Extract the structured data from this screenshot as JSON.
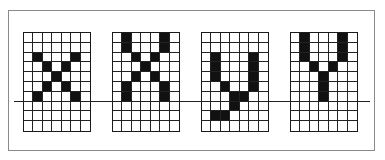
{
  "figure": {
    "grid_cols": 7,
    "grid_rows": 10,
    "baseline_row_after": 6,
    "glyphs": [
      {
        "name": "x",
        "left": 23,
        "pixels": [
          [
            2,
            1
          ],
          [
            2,
            5
          ],
          [
            3,
            2
          ],
          [
            3,
            4
          ],
          [
            4,
            3
          ],
          [
            5,
            2
          ],
          [
            5,
            4
          ],
          [
            6,
            1
          ],
          [
            6,
            5
          ]
        ]
      },
      {
        "name": "X",
        "left": 112,
        "pixels": [
          [
            0,
            1
          ],
          [
            0,
            5
          ],
          [
            1,
            1
          ],
          [
            1,
            5
          ],
          [
            2,
            2
          ],
          [
            2,
            4
          ],
          [
            3,
            3
          ],
          [
            4,
            2
          ],
          [
            4,
            4
          ],
          [
            5,
            1
          ],
          [
            5,
            5
          ],
          [
            6,
            1
          ],
          [
            6,
            5
          ]
        ]
      },
      {
        "name": "y",
        "left": 201,
        "pixels": [
          [
            2,
            1
          ],
          [
            2,
            5
          ],
          [
            3,
            1
          ],
          [
            3,
            5
          ],
          [
            4,
            1
          ],
          [
            4,
            5
          ],
          [
            5,
            2
          ],
          [
            5,
            5
          ],
          [
            6,
            3
          ],
          [
            6,
            4
          ],
          [
            7,
            3
          ],
          [
            8,
            1
          ],
          [
            8,
            2
          ]
        ]
      },
      {
        "name": "Y",
        "left": 290,
        "pixels": [
          [
            0,
            1
          ],
          [
            0,
            5
          ],
          [
            1,
            1
          ],
          [
            1,
            5
          ],
          [
            2,
            1
          ],
          [
            2,
            5
          ],
          [
            3,
            2
          ],
          [
            3,
            4
          ],
          [
            4,
            3
          ],
          [
            5,
            3
          ],
          [
            6,
            3
          ]
        ]
      }
    ]
  }
}
